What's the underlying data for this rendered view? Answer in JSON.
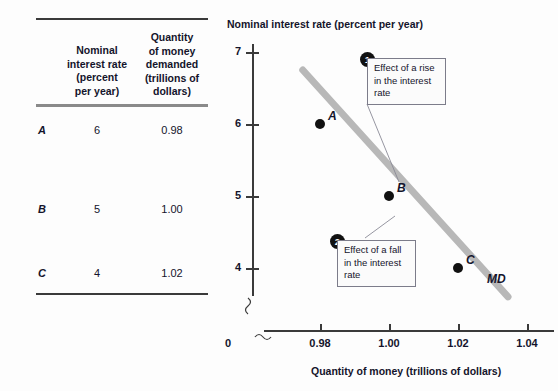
{
  "table": {
    "headers": {
      "col1": "Nominal\ninterest rate\n(percent\nper year)",
      "col2": "Quantity\nof money\ndemanded\n(trillions of\ndollars)"
    },
    "rows": [
      {
        "label": "A",
        "rate": "6",
        "quantity": "0.98"
      },
      {
        "label": "B",
        "rate": "5",
        "quantity": "1.00"
      },
      {
        "label": "C",
        "rate": "4",
        "quantity": "1.02"
      }
    ]
  },
  "chart_data": {
    "type": "line",
    "title": "",
    "xlabel": "Quantity of money (trillions of dollars)",
    "ylabel": "Nominal interest rate (percent per year)",
    "xlim": [
      0.97,
      1.05
    ],
    "ylim": [
      3.5,
      7.3
    ],
    "xticks": [
      "0.98",
      "1.00",
      "1.02",
      "1.04"
    ],
    "xtick_values": [
      0.98,
      1.0,
      1.02,
      1.04
    ],
    "yticks": [
      "7",
      "6",
      "5",
      "4"
    ],
    "ytick_values": [
      7,
      6,
      5,
      4
    ],
    "origin_label": "0",
    "axis_break": true,
    "grid": false,
    "legend": "none",
    "series": [
      {
        "name": "MD",
        "label": "MD",
        "color": "#b8b8b8",
        "x": [
          0.975,
          1.0345
        ],
        "y": [
          6.75,
          3.6
        ]
      }
    ],
    "points": [
      {
        "label": "A",
        "x": 0.98,
        "y": 6
      },
      {
        "label": "B",
        "x": 1.0,
        "y": 5
      },
      {
        "label": "C",
        "x": 1.02,
        "y": 4
      }
    ],
    "annotations": [
      {
        "number": "1",
        "text": "Effect of a rise in the interest rate"
      },
      {
        "number": "2",
        "text": "Effect of a fall in the interest rate"
      }
    ]
  },
  "colors": {
    "curve": "#b8b8b8",
    "point": "#111111",
    "axis": "#3a3a3a",
    "text": "#14142b",
    "callout_border": "#7c7c8a"
  }
}
